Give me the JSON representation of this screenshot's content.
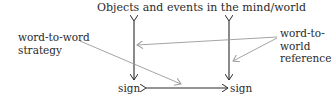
{
  "diagram": {
    "title": "Objects and events in the mind/world",
    "labels": {
      "word_to_word_line1": "word-to-word",
      "word_to_word_line2": "strategy",
      "word_to_world_line1": "word-to-",
      "word_to_world_line2": "world",
      "word_to_world_line3": "reference",
      "sign_left": "sign",
      "sign_right": "sign"
    },
    "colors": {
      "primary_arrow": "#2a2a2a",
      "annotation_arrow": "#9a9a9a",
      "text": "#2a2a2a"
    },
    "edges": [
      {
        "from": "sign_left",
        "to": "objects_and_events",
        "type": "bidirectional"
      },
      {
        "from": "sign_right",
        "to": "objects_and_events",
        "type": "bidirectional"
      },
      {
        "from": "sign_left",
        "to": "sign_right",
        "type": "bidirectional"
      },
      {
        "from": "word-to-word strategy",
        "to": "sign-to-sign arrow",
        "type": "annotation"
      },
      {
        "from": "word-to-world reference",
        "to": "left vertical arrow",
        "type": "annotation"
      },
      {
        "from": "word-to-world reference",
        "to": "right vertical arrow",
        "type": "annotation"
      }
    ]
  }
}
